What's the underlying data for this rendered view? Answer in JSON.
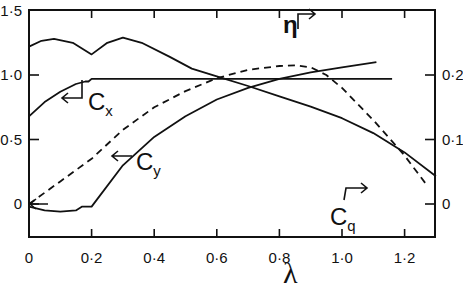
{
  "chart_data": {
    "type": "line",
    "title": "",
    "xlabel": "λ",
    "ylabel": "",
    "y2label": "",
    "xlim": [
      0,
      1.3
    ],
    "ylim": [
      -0.25,
      1.5
    ],
    "y2lim": [
      -0.05,
      0.3
    ],
    "x_ticks": [
      "0",
      "0·2",
      "0·4",
      "0·6",
      "0·8",
      "1·0",
      "1·2"
    ],
    "y_ticks": [
      "0",
      "0·5",
      "1·0",
      "1·5"
    ],
    "y2_ticks": [
      "0",
      "0·1",
      "0·2"
    ],
    "grid": false,
    "series": [
      {
        "name": "Cx",
        "label": "C",
        "sub": "x",
        "axis": "left",
        "style": "solid",
        "x": [
          0,
          0.05,
          0.1,
          0.15,
          0.18,
          0.19,
          0.2,
          0.4,
          0.6,
          0.8,
          1.0,
          1.16
        ],
        "y": [
          0.68,
          0.79,
          0.87,
          0.93,
          0.95,
          0.95,
          0.97,
          0.97,
          0.97,
          0.97,
          0.97,
          0.97
        ]
      },
      {
        "name": "Cy",
        "label": "C",
        "sub": "y",
        "axis": "left",
        "style": "solid",
        "x": [
          0,
          0.05,
          0.1,
          0.15,
          0.17,
          0.2,
          0.3,
          0.4,
          0.5,
          0.6,
          0.7,
          0.8,
          0.9,
          1.0,
          1.11
        ],
        "y": [
          -0.02,
          -0.05,
          -0.06,
          -0.05,
          -0.02,
          -0.02,
          0.3,
          0.52,
          0.68,
          0.81,
          0.9,
          0.97,
          1.02,
          1.06,
          1.1
        ]
      },
      {
        "name": "Cq",
        "label": "C",
        "sub": "q",
        "axis": "right",
        "style": "solid",
        "x": [
          0,
          0.04,
          0.08,
          0.14,
          0.2,
          0.25,
          0.3,
          0.36,
          0.45,
          0.52,
          0.6,
          0.7,
          0.8,
          0.9,
          1.0,
          1.1,
          1.2,
          1.3
        ],
        "y": [
          0.244,
          0.253,
          0.256,
          0.25,
          0.232,
          0.25,
          0.258,
          0.25,
          0.228,
          0.21,
          0.198,
          0.183,
          0.167,
          0.151,
          0.133,
          0.11,
          0.08,
          0.043
        ]
      },
      {
        "name": "η",
        "label": "η",
        "axis": "right",
        "style": "dashed",
        "x": [
          0,
          0.1,
          0.2,
          0.3,
          0.4,
          0.5,
          0.6,
          0.7,
          0.8,
          0.85,
          0.9,
          0.95,
          1.0,
          1.1,
          1.2,
          1.27
        ],
        "y": [
          0,
          0.035,
          0.07,
          0.115,
          0.15,
          0.175,
          0.195,
          0.208,
          0.214,
          0.215,
          0.212,
          0.2,
          0.18,
          0.13,
          0.075,
          0.03
        ]
      }
    ],
    "annotations": [
      {
        "text": "Cx",
        "arrow": "left"
      },
      {
        "text": "Cy",
        "arrow": "left"
      },
      {
        "text": "Cq",
        "arrow": "right"
      },
      {
        "text": "η",
        "arrow": "right"
      }
    ]
  }
}
